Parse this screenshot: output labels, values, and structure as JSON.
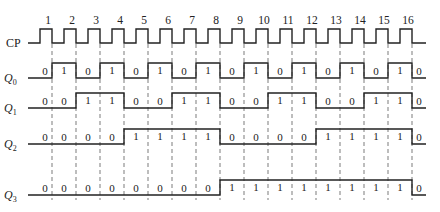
{
  "diagram": {
    "type": "timing-diagram",
    "title": "",
    "clock": {
      "label": "CP",
      "pulse_numbers": [
        "1",
        "2",
        "3",
        "4",
        "5",
        "6",
        "7",
        "8",
        "9",
        "10",
        "11",
        "12",
        "13",
        "14",
        "15",
        "16"
      ]
    },
    "signals": [
      {
        "label": "Q",
        "subscript": "0",
        "values": [
          "0",
          "1",
          "0",
          "1",
          "0",
          "1",
          "0",
          "1",
          "0",
          "1",
          "0",
          "1",
          "0",
          "1",
          "0",
          "1",
          "0"
        ]
      },
      {
        "label": "Q",
        "subscript": "1",
        "values": [
          "0",
          "0",
          "1",
          "1",
          "0",
          "0",
          "1",
          "1",
          "0",
          "0",
          "1",
          "1",
          "0",
          "0",
          "1",
          "1",
          "0"
        ]
      },
      {
        "label": "Q",
        "subscript": "2",
        "values": [
          "0",
          "0",
          "0",
          "0",
          "1",
          "1",
          "1",
          "1",
          "0",
          "0",
          "0",
          "0",
          "1",
          "1",
          "1",
          "1",
          "0"
        ]
      },
      {
        "label": "Q",
        "subscript": "3",
        "values": [
          "0",
          "0",
          "0",
          "0",
          "0",
          "0",
          "0",
          "0",
          "1",
          "1",
          "1",
          "1",
          "1",
          "1",
          "1",
          "1",
          "0"
        ]
      }
    ],
    "layout": {
      "start_x": 28,
      "first_edge_x": 52,
      "period": 24,
      "end_x": 426,
      "clock_high_y": 29,
      "clock_low_y": 43,
      "rows": [
        {
          "high_y": 63,
          "low_y": 78
        },
        {
          "high_y": 93,
          "low_y": 108
        },
        {
          "high_y": 129,
          "low_y": 144
        },
        {
          "high_y": 180,
          "low_y": 195
        }
      ],
      "guide_top": 44,
      "guide_bottom": 200
    },
    "colors": {
      "line": "#222222",
      "background": "#ffffff"
    }
  }
}
